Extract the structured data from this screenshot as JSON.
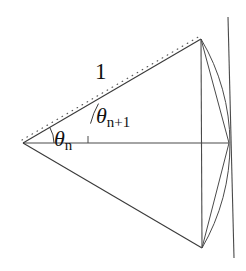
{
  "figure": {
    "kind": "geometry-diagram",
    "width": 246,
    "height": 271,
    "background_color": "#ffffff",
    "stroke_color": "#3a3a3a",
    "text_color": "#111111"
  },
  "labels": {
    "unit_length": "1",
    "theta_n": {
      "symbol": "θ",
      "subscript": "n",
      "full": "θn"
    },
    "theta_n_plus_1": {
      "symbol": "θ",
      "subscript": "n+1",
      "full": "θn+1"
    }
  },
  "geometry": {
    "apex": {
      "x": 23,
      "y": 143
    },
    "right_center": {
      "x": 229,
      "y": 143
    },
    "top_vertex": {
      "x": 201,
      "y": 39
    },
    "bottom_vertex": {
      "x": 202,
      "y": 248
    },
    "tangent_line_top": {
      "x": 228,
      "y": 17
    },
    "tangent_line_bottom": {
      "x": 234,
      "y": 258
    },
    "dotted_ray_end": {
      "x": 201,
      "y": 36
    },
    "horizontal_axis": {
      "from": {
        "x": 23,
        "y": 143
      },
      "to": {
        "x": 229,
        "y": 143
      }
    },
    "upper_ray": {
      "from": {
        "x": 23,
        "y": 143
      },
      "to": {
        "x": 201,
        "y": 39
      }
    },
    "lower_ray": {
      "from": {
        "x": 23,
        "y": 143
      },
      "to": {
        "x": 202,
        "y": 248
      }
    },
    "chord_vertical": {
      "from": {
        "x": 201,
        "y": 39
      },
      "to": {
        "x": 202,
        "y": 248
      }
    },
    "chord_upper": {
      "from": {
        "x": 201,
        "y": 39
      },
      "to": {
        "x": 229,
        "y": 143
      }
    },
    "chord_lower": {
      "from": {
        "x": 229,
        "y": 143
      },
      "to": {
        "x": 202,
        "y": 248
      }
    },
    "arc": {
      "start": {
        "x": 201,
        "y": 39
      },
      "apex_point": {
        "x": 229,
        "y": 143
      },
      "end": {
        "x": 202,
        "y": 248
      },
      "radius": 206
    },
    "angle_marker_theta_n": {
      "center": {
        "x": 23,
        "y": 143
      },
      "radius": 31,
      "from_deg": -30.3,
      "to_deg": 0
    },
    "angle_marker_theta_n_plus_1": {
      "center": {
        "x": 23,
        "y": 143
      },
      "radius": 78,
      "from_deg": -30.3,
      "to_deg": -14.5
    }
  },
  "annotations": {
    "description": "Angle theta-n between the horizontal axis and the lower ray; angle theta-n+1 between the lower ray and the upper ray. The dotted segment of length 1 runs from the apex to the top vertex."
  }
}
